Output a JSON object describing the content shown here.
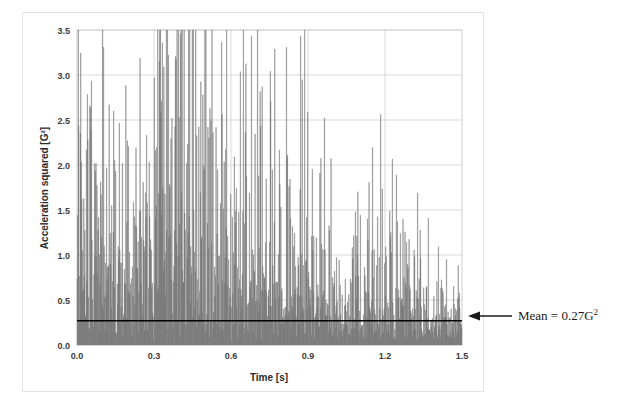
{
  "figure": {
    "background_color": "#ffffff",
    "frame_color": "#e3e3e3"
  },
  "chart_data": {
    "type": "bar",
    "title": "",
    "subtitle": "",
    "xlabel": "Time [s]",
    "ylabel": "Acceleration squared [G²]",
    "xlim": [
      0.0,
      1.5
    ],
    "ylim": [
      0.0,
      3.5
    ],
    "xticks": [
      0.0,
      0.3,
      0.6,
      0.9,
      1.2,
      1.5
    ],
    "xtick_labels": [
      "0.0",
      "0.3",
      "0.6",
      "0.9",
      "1.2",
      "1.5"
    ],
    "yticks": [
      0.0,
      0.5,
      1.0,
      1.5,
      2.0,
      2.5,
      3.0,
      3.5
    ],
    "ytick_labels": [
      "0.0",
      "0.5",
      "1.0",
      "1.5",
      "2.0",
      "2.5",
      "3.0",
      "3.5"
    ],
    "grid": "horizontal-and-vertical",
    "grid_color": "#d9d9d9",
    "legend": "none",
    "series": [
      {
        "name": "Acceleration squared",
        "color": "#808080",
        "style": "dense-vertical-bars",
        "n_points": 760,
        "description": "Dense vibration signal, acceleration squared, sampled over 1.5 s",
        "envelope_note": "Peak activity between t=0.3 and t=0.6; decaying toward both ends",
        "max_value": 3.22,
        "max_value_time": 0.355,
        "min_value": 0.05,
        "notable_peaks": [
          {
            "t": 0.005,
            "v": 2.44
          },
          {
            "t": 0.035,
            "v": 2.17
          },
          {
            "t": 0.115,
            "v": 1.97
          },
          {
            "t": 0.15,
            "v": 1.93
          },
          {
            "t": 0.175,
            "v": 2.02
          },
          {
            "t": 0.3,
            "v": 2.97
          },
          {
            "t": 0.355,
            "v": 3.22
          },
          {
            "t": 0.37,
            "v": 2.52
          },
          {
            "t": 0.43,
            "v": 2.23
          },
          {
            "t": 0.49,
            "v": 2.78
          },
          {
            "t": 0.51,
            "v": 2.42
          },
          {
            "t": 0.53,
            "v": 2.36
          },
          {
            "t": 0.565,
            "v": 2.56
          },
          {
            "t": 0.58,
            "v": 2.17
          },
          {
            "t": 0.82,
            "v": 2.11
          },
          {
            "t": 0.87,
            "v": 1.73
          },
          {
            "t": 0.99,
            "v": 2.07
          },
          {
            "t": 1.085,
            "v": 1.48
          },
          {
            "t": 1.245,
            "v": 1.89
          },
          {
            "t": 1.44,
            "v": 0.95
          }
        ]
      }
    ],
    "reference_line": {
      "name": "mean",
      "orientation": "horizontal",
      "value": 0.27,
      "color": "#000000",
      "label": "Mean = 0.27G²",
      "label_main": "Mean = 0.27G",
      "label_superscript": "2",
      "arrow": "left"
    }
  },
  "annotation": {
    "mean_label_main": "Mean = 0.27G",
    "mean_label_sup": "2"
  }
}
